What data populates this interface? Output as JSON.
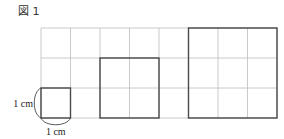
{
  "figure": {
    "title": "図 1",
    "grid": {
      "columns": 8,
      "rows": 3,
      "unit": "1 cm"
    },
    "squares": [
      {
        "name": "square-1cm",
        "side_cm": 1,
        "col": 0,
        "row": 2
      },
      {
        "name": "square-2cm",
        "side_cm": 2,
        "col": 2,
        "row": 1
      },
      {
        "name": "square-3cm",
        "side_cm": 3,
        "col": 5,
        "row": 0
      }
    ],
    "labels": {
      "vertical": "1 cm",
      "horizontal": "1 cm"
    }
  }
}
